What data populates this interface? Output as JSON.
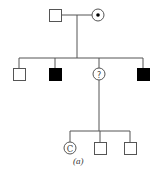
{
  "diagram": {
    "type": "pedigree",
    "caption": "(a)",
    "generations": [
      {
        "index": 1,
        "members": [
          {
            "id": "I-1",
            "sex": "male",
            "affected": false,
            "label": ""
          },
          {
            "id": "I-2",
            "sex": "female",
            "affected": false,
            "carrier": true,
            "label": ""
          }
        ]
      },
      {
        "index": 2,
        "members": [
          {
            "id": "II-1",
            "sex": "male",
            "affected": false,
            "label": ""
          },
          {
            "id": "II-2",
            "sex": "male",
            "affected": true,
            "label": ""
          },
          {
            "id": "II-3",
            "sex": "female",
            "affected": "unknown",
            "label": "?"
          },
          {
            "id": "II-4",
            "sex": "male",
            "affected": true,
            "label": ""
          }
        ]
      },
      {
        "index": 3,
        "members": [
          {
            "id": "III-1",
            "sex": "female",
            "affected": false,
            "label": "C"
          },
          {
            "id": "III-2",
            "sex": "male",
            "affected": false,
            "label": ""
          },
          {
            "id": "III-3",
            "sex": "male",
            "affected": false,
            "label": ""
          }
        ]
      }
    ]
  },
  "labels": {
    "unknown_mark": "?",
    "consultand_mark": "C",
    "caption": "(a)"
  },
  "colors": {
    "line": "#555555",
    "affected_fill": "#000000",
    "unaffected_fill": "#ffffff"
  }
}
